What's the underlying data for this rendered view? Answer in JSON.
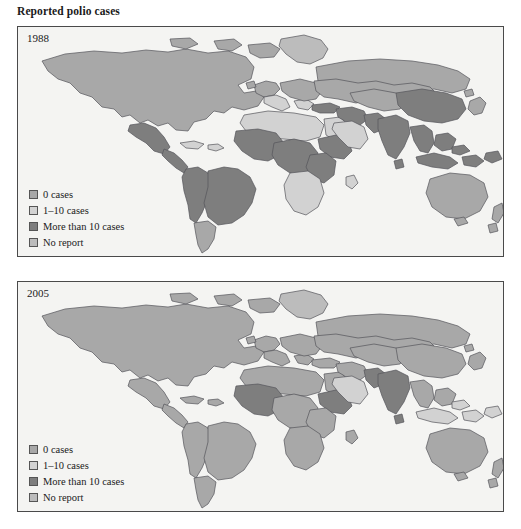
{
  "figure": {
    "title": "Reported polio cases",
    "background_color": "#ffffff",
    "panel_background_color": "#f4f4f2",
    "panel_border_color": "#4a4a4a",
    "country_border_color": "#55555a",
    "ocean_color": "#f4f4f2"
  },
  "legend": {
    "items": [
      {
        "label": "0 cases",
        "color": "#a8a8a8",
        "swatch_name": "swatch-0-cases"
      },
      {
        "label": "1–10 cases",
        "color": "#d2d2d2",
        "swatch_name": "swatch-1-10-cases"
      },
      {
        "label": "More than 10 cases",
        "color": "#7e7e7e",
        "swatch_name": "swatch-more-than-10-cases"
      },
      {
        "label": "No report",
        "color": "#bcbcbc",
        "swatch_name": "swatch-no-report"
      }
    ]
  },
  "panels": [
    {
      "id": "panel-1988",
      "year": "1988",
      "legend_title": null
    },
    {
      "id": "panel-2005",
      "year": "2005",
      "legend_title": null
    }
  ],
  "chart_data": {
    "type": "map",
    "title": "Reported polio cases",
    "subtitle": "",
    "map_projection": "world-equirectangular",
    "legend_position": "bottom-left",
    "categories": [
      "0 cases",
      "1–10 cases",
      "More than 10 cases",
      "No report"
    ],
    "category_colors": [
      "#a8a8a8",
      "#d2d2d2",
      "#7e7e7e",
      "#bcbcbc"
    ],
    "panels": [
      {
        "year": "1988",
        "note": "Polio endemic in most of Africa, South Asia, parts of Latin America and the Middle East.",
        "regions": [
          {
            "name": "North America",
            "category": "0 cases"
          },
          {
            "name": "Greenland",
            "category": "No report"
          },
          {
            "name": "Mexico",
            "category": "More than 10 cases"
          },
          {
            "name": "Central America",
            "category": "More than 10 cases"
          },
          {
            "name": "Caribbean",
            "category": "1–10 cases"
          },
          {
            "name": "Brazil",
            "category": "More than 10 cases"
          },
          {
            "name": "Andean South America",
            "category": "More than 10 cases"
          },
          {
            "name": "Southern Cone",
            "category": "0 cases"
          },
          {
            "name": "Western Europe",
            "category": "0 cases"
          },
          {
            "name": "Southern Europe",
            "category": "1–10 cases"
          },
          {
            "name": "Eastern Europe",
            "category": "0 cases"
          },
          {
            "name": "Russia",
            "category": "0 cases"
          },
          {
            "name": "North Africa",
            "category": "1–10 cases"
          },
          {
            "name": "West Africa",
            "category": "More than 10 cases"
          },
          {
            "name": "Central Africa",
            "category": "More than 10 cases"
          },
          {
            "name": "Horn of Africa",
            "category": "More than 10 cases"
          },
          {
            "name": "East Africa",
            "category": "More than 10 cases"
          },
          {
            "name": "Southern Africa",
            "category": "1–10 cases"
          },
          {
            "name": "Arabian Peninsula",
            "category": "1–10 cases"
          },
          {
            "name": "Middle East",
            "category": "More than 10 cases"
          },
          {
            "name": "Turkey",
            "category": "More than 10 cases"
          },
          {
            "name": "Central Asia",
            "category": "0 cases"
          },
          {
            "name": "India",
            "category": "More than 10 cases"
          },
          {
            "name": "Pakistan",
            "category": "More than 10 cases"
          },
          {
            "name": "China",
            "category": "More than 10 cases"
          },
          {
            "name": "Southeast Asia",
            "category": "More than 10 cases"
          },
          {
            "name": "Indonesia",
            "category": "More than 10 cases"
          },
          {
            "name": "Japan",
            "category": "0 cases"
          },
          {
            "name": "Australia",
            "category": "0 cases"
          },
          {
            "name": "New Zealand",
            "category": "0 cases"
          }
        ]
      },
      {
        "year": "2005",
        "note": "Polio eliminated from the Americas, Europe, East Asia and most of Africa; remaining cases concentrated in West Africa, the Horn of Africa and South Asia.",
        "regions": [
          {
            "name": "North America",
            "category": "0 cases"
          },
          {
            "name": "Greenland",
            "category": "No report"
          },
          {
            "name": "Mexico",
            "category": "0 cases"
          },
          {
            "name": "Central America",
            "category": "0 cases"
          },
          {
            "name": "Caribbean",
            "category": "0 cases"
          },
          {
            "name": "Brazil",
            "category": "0 cases"
          },
          {
            "name": "Andean South America",
            "category": "0 cases"
          },
          {
            "name": "Southern Cone",
            "category": "0 cases"
          },
          {
            "name": "Western Europe",
            "category": "0 cases"
          },
          {
            "name": "Southern Europe",
            "category": "0 cases"
          },
          {
            "name": "Eastern Europe",
            "category": "0 cases"
          },
          {
            "name": "Russia",
            "category": "0 cases"
          },
          {
            "name": "North Africa",
            "category": "0 cases"
          },
          {
            "name": "West Africa",
            "category": "More than 10 cases"
          },
          {
            "name": "Central Africa",
            "category": "0 cases"
          },
          {
            "name": "Horn of Africa",
            "category": "More than 10 cases"
          },
          {
            "name": "East Africa",
            "category": "0 cases"
          },
          {
            "name": "Southern Africa",
            "category": "0 cases"
          },
          {
            "name": "Arabian Peninsula",
            "category": "1–10 cases"
          },
          {
            "name": "Middle East",
            "category": "0 cases"
          },
          {
            "name": "Turkey",
            "category": "0 cases"
          },
          {
            "name": "Central Asia",
            "category": "0 cases"
          },
          {
            "name": "India",
            "category": "More than 10 cases"
          },
          {
            "name": "Pakistan",
            "category": "More than 10 cases"
          },
          {
            "name": "China",
            "category": "0 cases"
          },
          {
            "name": "Southeast Asia",
            "category": "0 cases"
          },
          {
            "name": "Indonesia",
            "category": "1–10 cases"
          },
          {
            "name": "Japan",
            "category": "0 cases"
          },
          {
            "name": "Australia",
            "category": "0 cases"
          },
          {
            "name": "New Zealand",
            "category": "0 cases"
          }
        ]
      }
    ]
  }
}
